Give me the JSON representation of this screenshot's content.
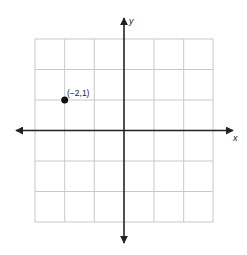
{
  "diagram": {
    "type": "coordinate-plane",
    "grid": {
      "cols": 6,
      "rows": 6,
      "x_range": [
        -3,
        3
      ],
      "y_range": [
        -3,
        3
      ]
    },
    "axes": {
      "x_label": "x",
      "y_label": "y"
    },
    "points": [
      {
        "x": -2,
        "y": 1,
        "label": "(−2,1)"
      }
    ],
    "colors": {
      "grid": "#c8c8c8",
      "axis": "#222222",
      "point": "#111111"
    }
  }
}
